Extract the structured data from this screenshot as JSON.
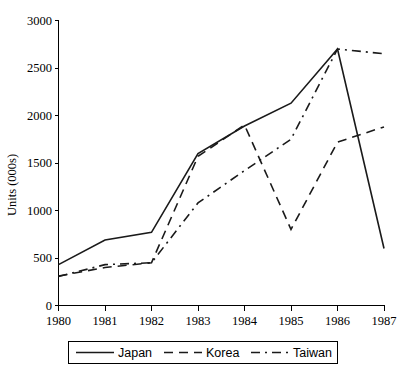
{
  "chart_data": {
    "type": "line",
    "title": "",
    "xlabel": "",
    "ylabel": "Units (000s)",
    "x": [
      1980,
      1981,
      1982,
      1983,
      1984,
      1985,
      1986,
      1987
    ],
    "categories": [
      "1980",
      "1981",
      "1982",
      "1983",
      "1984",
      "1985",
      "1986",
      "1987"
    ],
    "xlim": [
      1980,
      1987
    ],
    "ylim": [
      0,
      3000
    ],
    "yticks": [
      0,
      500,
      1000,
      1500,
      2000,
      2500,
      3000
    ],
    "ytick_labels": [
      "0",
      "500",
      "1000",
      "1500",
      "2000",
      "2500",
      "3000"
    ],
    "grid": false,
    "legend_position": "bottom",
    "series": [
      {
        "name": "Japan",
        "style": "solid",
        "values": [
          430,
          690,
          770,
          1600,
          1890,
          2130,
          2700,
          600
        ]
      },
      {
        "name": "Korea",
        "style": "dashed",
        "values": [
          310,
          400,
          450,
          1570,
          1900,
          800,
          1720,
          1880
        ]
      },
      {
        "name": "Taiwan",
        "style": "dash-dot",
        "values": [
          305,
          430,
          450,
          1080,
          1420,
          1750,
          2700,
          2650
        ]
      }
    ]
  },
  "axis": {
    "y_title": "Units (000s)",
    "x_tick_labels": [
      "1980",
      "1981",
      "1982",
      "1983",
      "1984",
      "1985",
      "1986",
      "1987"
    ],
    "y_tick_labels": [
      "3000",
      "2500",
      "2000",
      "1500",
      "1000",
      "500",
      "0"
    ]
  },
  "legend": {
    "items": [
      {
        "label": "Japan",
        "style": "solid"
      },
      {
        "label": "Korea",
        "style": "dashed"
      },
      {
        "label": "Taiwan",
        "style": "dash-dot"
      }
    ]
  },
  "colors": {
    "line": "#1a1a1a",
    "axis": "#000000",
    "background": "#ffffff"
  }
}
